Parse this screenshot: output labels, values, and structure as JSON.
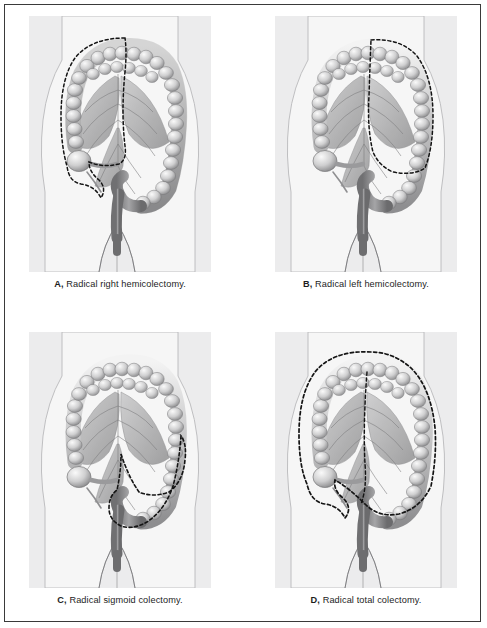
{
  "figure": {
    "type": "medical-illustration-plate",
    "modality": "grayscale anatomical drawing",
    "panel_count": 4,
    "layout": "2 x 2 grid",
    "border_color": "#3a3a3a",
    "panel_background": "#ececed",
    "page_background": "#ffffff",
    "ink_color": "#5e5e5e",
    "dash_color": "#141414"
  },
  "panels": [
    {
      "id": "A",
      "label": "A,",
      "caption": "Radical right hemicolectomy.",
      "full_caption": "A, Radical right hemicolectomy.",
      "resection_region": "terminal ileum, cecum, appendix, ascending colon, hepatic flexure and proximal transverse colon",
      "dashed_margin": "encircles the right colon from terminal ileum to mid transverse colon"
    },
    {
      "id": "B",
      "label": "B,",
      "caption": "Radical left hemicolectomy.",
      "full_caption": "B, Radical left hemicolectomy.",
      "resection_region": "distal transverse colon, splenic flexure, descending colon and proximal sigmoid colon",
      "dashed_margin": "encircles the left colon from mid transverse colon to sigmoid"
    },
    {
      "id": "C",
      "label": "C,",
      "caption": "Radical sigmoid colectomy.",
      "full_caption": "C, Radical sigmoid colectomy.",
      "resection_region": "sigmoid colon with distal descending colon and upper rectum",
      "dashed_margin": "encircles the sigmoid loop down to the rectosigmoid junction"
    },
    {
      "id": "D",
      "label": "D,",
      "caption": "Radical total colectomy.",
      "full_caption": "D, Radical total colectomy.",
      "resection_region": "entire colon from terminal ileum to rectosigmoid junction",
      "dashed_margin": "encircles the whole colon including both flexures and the sigmoid"
    }
  ],
  "anatomy_labels": {
    "body": "anterior abdominal wall silhouette",
    "colon": "large intestine with haustra",
    "mesentery": "mesenteric vessels and lymphatic arcades",
    "cecum": "cecum",
    "appendix": "vermiform appendix",
    "ileum": "terminal ileum",
    "rectum": "rectum"
  }
}
